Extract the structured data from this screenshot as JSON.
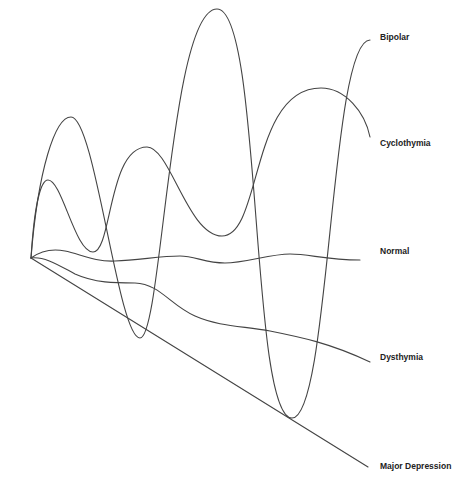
{
  "diagram": {
    "type": "mood-spectrum curves",
    "origin": [
      31,
      258
    ],
    "stroke_color": "#444444",
    "label_color": "#222222",
    "background": "#ffffff",
    "series": [
      {
        "name": "Bipolar",
        "label_pos": [
          380,
          37
        ],
        "path": "M31,258 C38,170 55,117 71,117 C95,117 118,338 140,338 C162,338 170,9 217,9 C262,9 250,418 292,418 C330,418 330,40 370,40"
      },
      {
        "name": "Cyclothymia",
        "label_pos": [
          380,
          143
        ],
        "path": "M31,258 C34,210 40,180 48,180 C62,180 75,252 93,252 C112,252 108,147 147,147 C170,147 188,236 222,236 C262,236 250,88 321,88 C345,88 365,112 370,137"
      },
      {
        "name": "Normal",
        "label_pos": [
          380,
          251
        ],
        "path": "M31,258 C42,250 55,249 65,251 C80,254 95,262 115,261 C140,260 160,256 180,256 C195,256 205,263 225,263 C245,263 270,254 290,254 C310,254 325,260 360,260"
      },
      {
        "name": "Dysthymia",
        "label_pos": [
          380,
          357
        ],
        "path": "M31,258 C45,256 60,266 75,274 C95,283 115,283 135,283 C160,284 170,305 195,316 C220,327 245,326 270,331 C300,337 330,343 370,362"
      },
      {
        "name": "Major Depression",
        "label_pos": [
          380,
          466
        ],
        "path": "M31,258 L368,467"
      }
    ]
  },
  "chart_data": {
    "type": "line",
    "title": "",
    "xlabel": "",
    "ylabel": "",
    "grid": false,
    "legend_position": "right (inline labels)",
    "series": [
      {
        "name": "Bipolar",
        "description": "large-amplitude oscillation",
        "points": [
          [
            31,
            258
          ],
          [
            71,
            117
          ],
          [
            140,
            338
          ],
          [
            217,
            9
          ],
          [
            292,
            418
          ],
          [
            370,
            40
          ]
        ]
      },
      {
        "name": "Cyclothymia",
        "description": "moderate-amplitude oscillation",
        "points": [
          [
            31,
            258
          ],
          [
            48,
            180
          ],
          [
            93,
            252
          ],
          [
            147,
            147
          ],
          [
            222,
            236
          ],
          [
            321,
            88
          ],
          [
            370,
            137
          ]
        ]
      },
      {
        "name": "Normal",
        "description": "near-flat gentle waves",
        "points": [
          [
            31,
            258
          ],
          [
            65,
            251
          ],
          [
            115,
            261
          ],
          [
            180,
            256
          ],
          [
            225,
            263
          ],
          [
            290,
            254
          ],
          [
            360,
            260
          ]
        ]
      },
      {
        "name": "Dysthymia",
        "description": "gradual downward drift",
        "points": [
          [
            31,
            258
          ],
          [
            75,
            274
          ],
          [
            135,
            283
          ],
          [
            195,
            316
          ],
          [
            270,
            331
          ],
          [
            370,
            362
          ]
        ]
      },
      {
        "name": "Major Depression",
        "description": "straight downward line",
        "points": [
          [
            31,
            258
          ],
          [
            368,
            467
          ]
        ]
      }
    ]
  }
}
